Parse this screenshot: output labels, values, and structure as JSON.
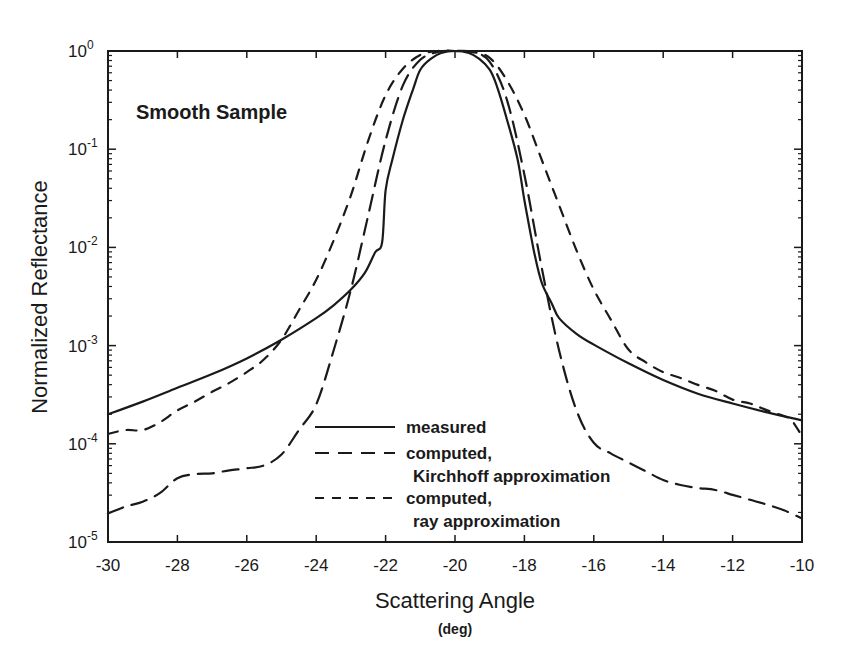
{
  "chart_data": {
    "type": "line",
    "title": "",
    "annotation": "Smooth Sample",
    "xlabel": "Scattering Angle",
    "xlabel_unit": "(deg)",
    "ylabel": "Normalized Reflectance",
    "xlim": [
      -30,
      -10
    ],
    "ylim": [
      1e-05,
      1
    ],
    "yscale": "log",
    "grid": false,
    "legend_position": "lower center",
    "x_ticks": [
      -30,
      -28,
      -26,
      -24,
      -22,
      -20,
      -18,
      -16,
      -14,
      -12,
      -10
    ],
    "x_tick_labels": [
      "-30",
      "-28",
      "-26",
      "-24",
      "-22",
      "-20",
      "-18",
      "-16",
      "-14",
      "-12",
      "-10"
    ],
    "y_ticks": [
      {
        "base": "10",
        "exp": "0",
        "value": 1
      },
      {
        "base": "10",
        "exp": "-1",
        "value": 0.1
      },
      {
        "base": "10",
        "exp": "-2",
        "value": 0.01
      },
      {
        "base": "10",
        "exp": "-3",
        "value": 0.001
      },
      {
        "base": "10",
        "exp": "-4",
        "value": 0.0001
      },
      {
        "base": "10",
        "exp": "-5",
        "value": 1e-05
      }
    ],
    "series": [
      {
        "name": "measured",
        "legend_lines": [
          "measured"
        ],
        "style": "solid",
        "color": "#1a1a1a",
        "x": [
          -30,
          -29,
          -28,
          -27,
          -26,
          -25,
          -24,
          -23.5,
          -23,
          -22.6,
          -22.3,
          -22.1,
          -22,
          -21.8,
          -21.5,
          -21.2,
          -21,
          -20.7,
          -20.4,
          -20,
          -19.6,
          -19.3,
          -19,
          -18.8,
          -18.5,
          -18.2,
          -18,
          -17.8,
          -17.7,
          -17.5,
          -17.2,
          -17,
          -16.5,
          -16,
          -15,
          -14,
          -13,
          -12,
          -11,
          -10
        ],
        "log10": [
          -3.7,
          -3.57,
          -3.43,
          -3.29,
          -3.13,
          -2.94,
          -2.72,
          -2.59,
          -2.43,
          -2.26,
          -2.05,
          -1.95,
          -1.42,
          -1.1,
          -0.7,
          -0.38,
          -0.19,
          -0.08,
          -0.02,
          0.0,
          -0.02,
          -0.08,
          -0.19,
          -0.35,
          -0.7,
          -1.1,
          -1.52,
          -1.9,
          -2.08,
          -2.36,
          -2.58,
          -2.72,
          -2.88,
          -2.99,
          -3.18,
          -3.35,
          -3.49,
          -3.59,
          -3.68,
          -3.76
        ]
      },
      {
        "name": "computed, Kirchhoff approximation",
        "legend_lines": [
          "computed,",
          "Kirchhoff approximation"
        ],
        "style": "long-dash",
        "color": "#1a1a1a",
        "x": [
          -30,
          -29.5,
          -29,
          -28.5,
          -28,
          -27.5,
          -27,
          -26.5,
          -26,
          -25.5,
          -25,
          -24.5,
          -24,
          -23.5,
          -23,
          -22.5,
          -22,
          -21.5,
          -21,
          -20.5,
          -20,
          -19.5,
          -19,
          -18.5,
          -18,
          -17.5,
          -17,
          -16.5,
          -16,
          -15.5,
          -15,
          -14.5,
          -14,
          -13.5,
          -13,
          -12.5,
          -12,
          -11.5,
          -11,
          -10.5,
          -10
        ],
        "log10": [
          -4.71,
          -4.64,
          -4.59,
          -4.5,
          -4.35,
          -4.31,
          -4.3,
          -4.27,
          -4.25,
          -4.22,
          -4.11,
          -3.86,
          -3.6,
          -3.05,
          -2.43,
          -1.67,
          -0.91,
          -0.35,
          -0.09,
          -0.01,
          0.0,
          -0.01,
          -0.11,
          -0.5,
          -1.26,
          -2.21,
          -3.05,
          -3.66,
          -3.99,
          -4.1,
          -4.19,
          -4.28,
          -4.37,
          -4.42,
          -4.45,
          -4.47,
          -4.52,
          -4.57,
          -4.62,
          -4.68,
          -4.76
        ]
      },
      {
        "name": "computed, ray approximation",
        "legend_lines": [
          "computed,",
          "ray approximation"
        ],
        "style": "short-dash",
        "color": "#1a1a1a",
        "x": [
          -30,
          -29.5,
          -29,
          -28.5,
          -28,
          -27.5,
          -27,
          -26.5,
          -26,
          -25.5,
          -25,
          -24.5,
          -24,
          -23.5,
          -23,
          -22.5,
          -22,
          -21.5,
          -21,
          -20.5,
          -20,
          -19.5,
          -19,
          -18.5,
          -18,
          -17.5,
          -17,
          -16.5,
          -16,
          -15.5,
          -15,
          -14.5,
          -14,
          -13.5,
          -13,
          -12.5,
          -12,
          -11.5,
          -11,
          -10.5,
          -10.3,
          -10
        ],
        "log10": [
          -3.9,
          -3.86,
          -3.86,
          -3.78,
          -3.66,
          -3.57,
          -3.47,
          -3.38,
          -3.27,
          -3.14,
          -2.94,
          -2.64,
          -2.33,
          -1.93,
          -1.47,
          -0.91,
          -0.45,
          -0.18,
          -0.04,
          0.0,
          0.0,
          -0.01,
          -0.07,
          -0.3,
          -0.65,
          -1.11,
          -1.57,
          -2.03,
          -2.43,
          -2.74,
          -3.04,
          -3.17,
          -3.27,
          -3.33,
          -3.4,
          -3.46,
          -3.55,
          -3.59,
          -3.66,
          -3.72,
          -3.76,
          -3.92
        ]
      }
    ]
  },
  "layout": {
    "plot_left": 108,
    "plot_right": 802,
    "plot_top": 51,
    "plot_bottom": 542
  }
}
